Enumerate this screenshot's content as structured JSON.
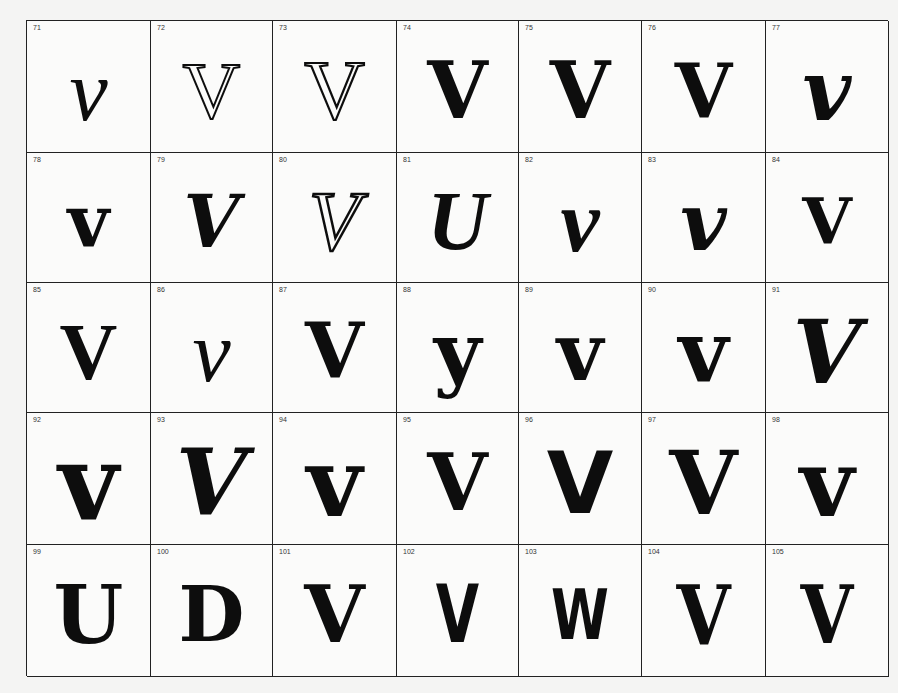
{
  "page": {
    "background": "#f4f4f3",
    "ink": "#0d0d0d"
  },
  "cells": [
    {
      "num": "71",
      "glyph": "v",
      "style": "italic-script"
    },
    {
      "num": "72",
      "glyph": "V",
      "style": "outline-serif"
    },
    {
      "num": "73",
      "glyph": "V",
      "style": "inline-serif"
    },
    {
      "num": "74",
      "glyph": "V",
      "style": "ornate-curled"
    },
    {
      "num": "75",
      "glyph": "V",
      "style": "spurred-blackletter"
    },
    {
      "num": "76",
      "glyph": "V",
      "style": "bold-slab"
    },
    {
      "num": "77",
      "glyph": "v",
      "style": "bold-italic"
    },
    {
      "num": "78",
      "glyph": "v",
      "style": "looped-uncial"
    },
    {
      "num": "79",
      "glyph": "V",
      "style": "swash-bold"
    },
    {
      "num": "80",
      "glyph": "V",
      "style": "shaded-script"
    },
    {
      "num": "81",
      "glyph": "U",
      "style": "inline-script"
    },
    {
      "num": "82",
      "glyph": "v",
      "style": "swash-script"
    },
    {
      "num": "83",
      "glyph": "v",
      "style": "heavy-swash"
    },
    {
      "num": "84",
      "glyph": "V",
      "style": "curled-tendril"
    },
    {
      "num": "85",
      "glyph": "V",
      "style": "flared-roman"
    },
    {
      "num": "86",
      "glyph": "v",
      "style": "light-script"
    },
    {
      "num": "87",
      "glyph": "V",
      "style": "bold-curl"
    },
    {
      "num": "88",
      "glyph": "y",
      "style": "tailed-bold"
    },
    {
      "num": "89",
      "glyph": "v",
      "style": "curled-narrow"
    },
    {
      "num": "90",
      "glyph": "v",
      "style": "heavy-uncial"
    },
    {
      "num": "91",
      "glyph": "V",
      "style": "wide-swash"
    },
    {
      "num": "92",
      "glyph": "v",
      "style": "heavy-curl-left"
    },
    {
      "num": "93",
      "glyph": "V",
      "style": "heavy-sweep"
    },
    {
      "num": "94",
      "glyph": "v",
      "style": "bold-curl-round"
    },
    {
      "num": "95",
      "glyph": "V",
      "style": "curled-inner"
    },
    {
      "num": "96",
      "glyph": "V",
      "style": "heavy-wedge"
    },
    {
      "num": "97",
      "glyph": "V",
      "style": "heavy-flared"
    },
    {
      "num": "98",
      "glyph": "v",
      "style": "heavy-curl-right"
    },
    {
      "num": "99",
      "glyph": "U",
      "style": "pointed-blackletter"
    },
    {
      "num": "100",
      "glyph": "D",
      "style": "rounded-blob"
    },
    {
      "num": "101",
      "glyph": "V",
      "style": "spiral-arm"
    },
    {
      "num": "102",
      "glyph": "V",
      "style": "condensed-flare"
    },
    {
      "num": "103",
      "glyph": "W",
      "style": "ligature-ornate"
    },
    {
      "num": "104",
      "glyph": "V",
      "style": "tuscan-flared"
    },
    {
      "num": "105",
      "glyph": "V",
      "style": "dotted-flared"
    }
  ]
}
